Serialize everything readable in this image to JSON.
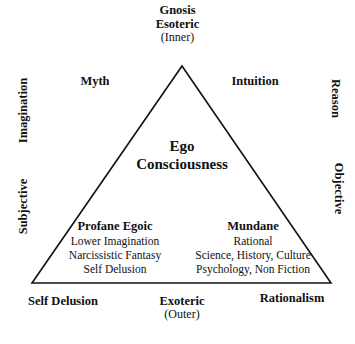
{
  "diagram": {
    "title_group": {
      "line1": "Gnosis",
      "line2": "Esoteric",
      "line3": "(Inner)"
    },
    "upper_flanks": {
      "left": "Myth",
      "right": "Intuition"
    },
    "sides": {
      "left_upper": "Imagination",
      "left_lower": "Subjective",
      "right_upper": "Reason",
      "right_lower": "Objective"
    },
    "center": {
      "line1": "Ego",
      "line2": "Consciousness"
    },
    "blocks": {
      "left": {
        "title": "Profane Egoic",
        "lines": [
          "Lower Imagination",
          "Narcissistic Fantasy",
          "Self Delusion"
        ]
      },
      "right": {
        "title": "Mundane",
        "lines": [
          "Rational",
          "Science, History, Culture",
          "Psychology, Non Fiction"
        ]
      }
    },
    "bottom": {
      "left": "Self Delusion",
      "center_line1": "Exoteric",
      "center_line2": "(Outer)",
      "right": "Rationalism"
    },
    "shape": {
      "name": "triangle",
      "apex_x": 182,
      "apex_y": 66,
      "base_left_x": 32,
      "base_right_x": 331,
      "base_y": 283,
      "stroke_color": "#111111",
      "stroke_width": 1.6,
      "fill_color": "#ffffff"
    },
    "background_color": "#ffffff"
  }
}
